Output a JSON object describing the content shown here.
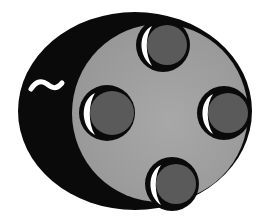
{
  "figure": {
    "colors": {
      "background": "#ffffff",
      "outline": "#0a0a0a",
      "face": "#9a9a9a",
      "hole": "#5a5a5a",
      "highlight": "#ffffff"
    },
    "holes": [
      {
        "name": "top",
        "cx": 163,
        "cy": 45,
        "r": 24
      },
      {
        "name": "left",
        "cx": 107,
        "cy": 113,
        "r": 25
      },
      {
        "name": "right",
        "cx": 224,
        "cy": 113,
        "r": 24
      },
      {
        "name": "bottom",
        "cx": 172,
        "cy": 184,
        "r": 24
      }
    ],
    "squiggle": "~"
  }
}
